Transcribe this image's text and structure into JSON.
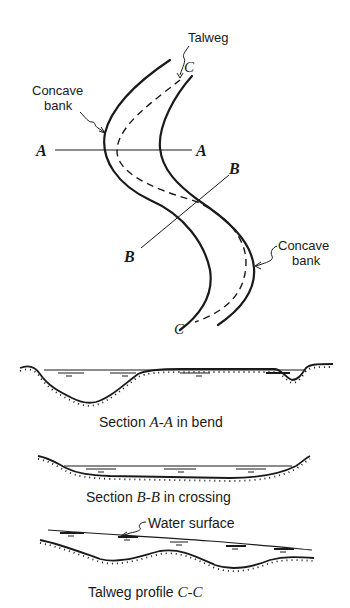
{
  "plan_view": {
    "labels": {
      "talweg": "Talweg",
      "concave_bank_upper_line1": "Concave",
      "concave_bank_upper_line2": "bank",
      "concave_bank_lower_line1": "Concave",
      "concave_bank_lower_line2": "bank",
      "section_a_left": "A",
      "section_a_right": "A",
      "section_b_upper": "B",
      "section_b_lower": "B",
      "section_c_upper": "C",
      "section_c_lower": "C"
    }
  },
  "sections": [
    {
      "id": "A-A",
      "caption_prefix": "Section ",
      "caption_italic": "A-A",
      "caption_suffix": " in bend"
    },
    {
      "id": "B-B",
      "caption_prefix": "Section ",
      "caption_italic": "B-B",
      "caption_suffix": " in crossing"
    },
    {
      "id": "C-C",
      "caption_prefix": "Talweg profile ",
      "caption_italic": "C-C",
      "caption_suffix": "",
      "annotation": "Water surface"
    }
  ],
  "colors": {
    "ink": "#1a1a1a",
    "background": "#ffffff"
  }
}
